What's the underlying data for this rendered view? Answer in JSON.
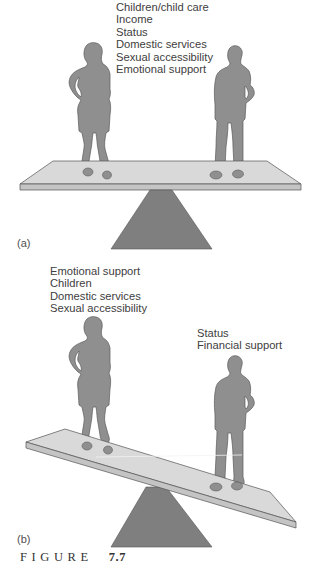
{
  "panel_a": {
    "tag": "(a)",
    "woman_side": [],
    "man_side_labels": [
      "Children/child care",
      "Income",
      "Status",
      "Domestic services",
      "Sexual accessibility",
      "Emotional support"
    ]
  },
  "panel_b": {
    "tag": "(b)",
    "woman_side_labels": [
      "Emotional support",
      "Children",
      "Domestic services",
      "Sexual accessibility"
    ],
    "man_side_labels": [
      "Status",
      "Financial support"
    ]
  },
  "caption": {
    "word": "FIGURE",
    "number": "7.7"
  },
  "colors": {
    "figure_fill": "#8f8f8f",
    "figure_outline": "#5a5a5a",
    "board_top": "#d9d9d9",
    "board_edge": "#c4c4c4",
    "fulcrum": "#7f7f7f",
    "text": "#404040"
  }
}
